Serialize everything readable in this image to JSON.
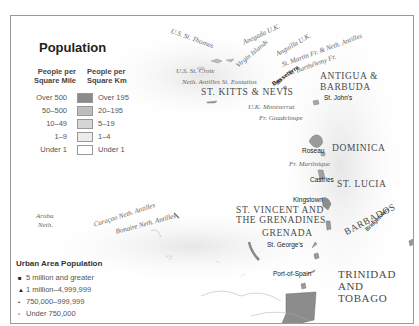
{
  "legend": {
    "title": "Population",
    "col_left_header": "People per Square Mile",
    "col_right_header": "People per Square Km",
    "rows": [
      {
        "mile": "Over 500",
        "km": "Over 195",
        "color": "#8c8c8c"
      },
      {
        "mile": "50–500",
        "km": "20–195",
        "color": "#bdbdbd"
      },
      {
        "mile": "10–49",
        "km": "5–19",
        "color": "#d6d6d6"
      },
      {
        "mile": "1–9",
        "km": "1–4",
        "color": "#ececec"
      },
      {
        "mile": "Under 1",
        "km": "Under 1",
        "color": "#ffffff"
      }
    ]
  },
  "urban": {
    "title": "Urban Area Population",
    "rows": [
      {
        "marker": "■",
        "label": "5 million and greater"
      },
      {
        "marker": "▲",
        "label": "1 million–4,999,999"
      },
      {
        "marker": "•",
        "label": "750,000–999,999"
      },
      {
        "marker": "▫",
        "label": "Under 750,000"
      }
    ]
  },
  "labels": {
    "st_thomas": "U.S. St. Thomas",
    "anegada": "Anegada U.K.",
    "virgin_islands": "Virgin Islands",
    "anguilla": "Anguilla U.K.",
    "st_martin": "St. Martin Fr. & Neth. Antilles",
    "st_barthelemy": "St. Barthélemy Fr.",
    "st_croix": "U.S. St. Croix",
    "st_eustatius": "Neth. Antilles St. Eustatius",
    "basseterre": "Basseterre",
    "st_kitts": "ST. KITTS & NEVIS",
    "antigua_1": "ANTIGUA &",
    "antigua_2": "BARBUDA",
    "st_johns": "St. John's",
    "montserrat": "U.K. Montserrat",
    "guadeloupe": "Fr. Guadeloupe",
    "roseau": "Roseau",
    "dominica": "DOMINICA",
    "martinique": "Fr. Martinique",
    "castries": "Castries",
    "st_lucia": "ST. LUCIA",
    "kingstown": "Kingstown",
    "st_vincent_1": "ST. VINCENT AND",
    "st_vincent_2": "THE GRENADINES",
    "grenada": "GRENADA",
    "st_georges": "St. George's",
    "barbados": "BARBADOS",
    "bridgetown": "Bridgetown",
    "port_of_spain": "Port-of-Spain",
    "trinidad_1": "TRINIDAD",
    "trinidad_2": "AND",
    "trinidad_3": "TOBAGO",
    "aruba": "Aruba",
    "aruba_neth": "Neth.",
    "curacao": "Curaçao Neth. Antilles",
    "bonaire": "Bonaire Neth. Antilles"
  }
}
